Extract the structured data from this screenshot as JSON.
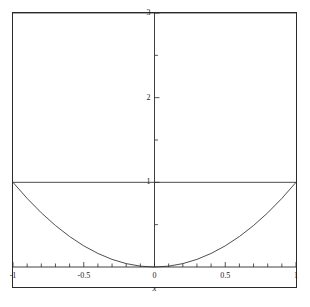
{
  "chart_data": {
    "type": "line",
    "title": "",
    "subtitle": "",
    "xlabel": "x",
    "ylabel": "",
    "xlim": [
      -1,
      1
    ],
    "ylim": [
      0,
      3
    ],
    "grid": false,
    "legend": null,
    "background": "#ffffff",
    "frame_color": "#2b2b2b",
    "curve_color": "#3a3a3a",
    "xticks": [
      -1,
      -0.5,
      0,
      0.5,
      1
    ],
    "xtick_labels": [
      "-1",
      "-0.5",
      "0",
      "0.5",
      "1"
    ],
    "xminor_step": 0.1,
    "yticks": [
      1,
      2,
      3
    ],
    "ytick_labels": [
      "1",
      "2",
      "3"
    ],
    "yminor_step": 0.5,
    "series": [
      {
        "name": "parabola",
        "kind": "curve",
        "expression": "y = x^2",
        "x": [
          -1,
          -0.9,
          -0.8,
          -0.7,
          -0.6,
          -0.5,
          -0.4,
          -0.3,
          -0.2,
          -0.1,
          0,
          0.1,
          0.2,
          0.3,
          0.4,
          0.5,
          0.6,
          0.7,
          0.8,
          0.9,
          1
        ],
        "values": [
          1,
          0.81,
          0.64,
          0.49,
          0.36,
          0.25,
          0.16,
          0.09,
          0.04,
          0.01,
          0,
          0.01,
          0.04,
          0.09,
          0.16,
          0.25,
          0.36,
          0.49,
          0.64,
          0.81,
          1
        ]
      },
      {
        "name": "horizontal-line-y1",
        "kind": "horizontal-line",
        "expression": "y = 1",
        "y": 1,
        "x": [
          -1,
          1
        ]
      },
      {
        "name": "horizontal-line-y3",
        "kind": "horizontal-line",
        "expression": "y = 3",
        "y": 3,
        "x": [
          -1,
          1
        ]
      }
    ]
  },
  "axes": {
    "x_axis_title": "x",
    "x_tick_labels": [
      "-1",
      "-0.5",
      "0",
      "0.5",
      "1"
    ],
    "y_tick_labels": [
      "1",
      "2",
      "3"
    ]
  }
}
